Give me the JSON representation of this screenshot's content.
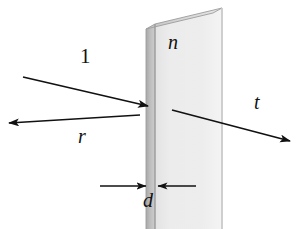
{
  "figure": {
    "background_color": "#ffffff",
    "ink_color": "#111111"
  },
  "labels": {
    "incident_ray": "1",
    "index_of_refraction": "n",
    "transmitted_ray": "t",
    "reflected_ray": "r",
    "thickness": "d"
  },
  "slab": {
    "name": "dielectric-slab",
    "face_color": "#e9e9e9",
    "edge_color": "#b5b5b5",
    "top_color": "#d6d6d6",
    "outline_color": "#9a9a9a",
    "front_face_left_x": 155,
    "front_face_right_x": 222,
    "edge_strip_left_x": 146,
    "top_y_left": 24,
    "top_y_right": 8,
    "bottom_y": 229
  },
  "rays": [
    {
      "name": "incident-ray",
      "label": "1",
      "from": [
        23,
        77
      ],
      "to": [
        148,
        106
      ],
      "arrowhead": "end"
    },
    {
      "name": "reflected-ray",
      "label": "r",
      "from": [
        140,
        115
      ],
      "to": [
        8,
        123
      ],
      "arrowhead": "end"
    },
    {
      "name": "transmitted-ray",
      "label": "t",
      "from": [
        172,
        110
      ],
      "to": [
        290,
        141
      ],
      "arrowhead": "end"
    }
  ],
  "dimension": {
    "name": "thickness-dimension",
    "label": "d",
    "left_line": {
      "from": [
        100,
        186
      ],
      "to": [
        146,
        186
      ]
    },
    "right_line": {
      "from": [
        195,
        186
      ],
      "to": [
        157,
        186
      ]
    },
    "measures_between_x": [
      146,
      155
    ]
  }
}
